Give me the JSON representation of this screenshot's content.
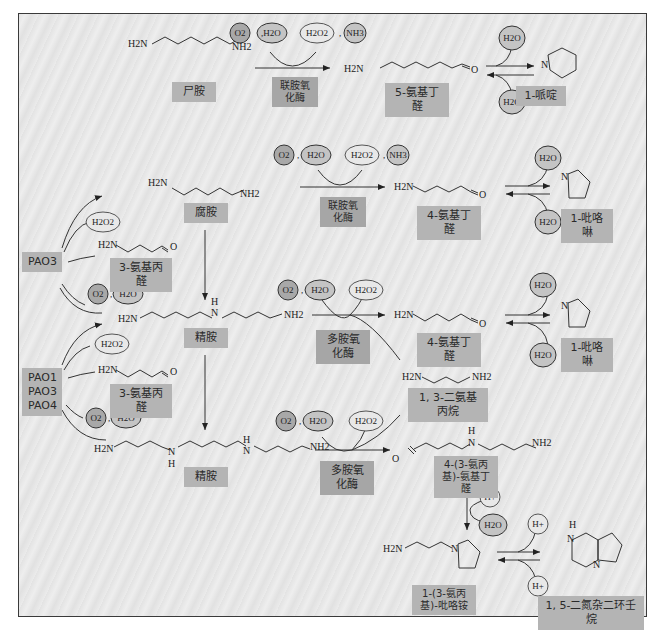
{
  "figure": {
    "colors": {
      "frame_border": "#3a3a3a",
      "label_bg": "#b4b4b4",
      "reactant_circle_fill": "#a8a8a8",
      "water_circle_fill": "#c4c4c4",
      "product_circle_fill": "#e8e8e8"
    },
    "row1": {
      "substrate_formula_left": "H2N",
      "substrate_formula_right": "NH2",
      "substrate_label": "尸胺",
      "cofactors_in": [
        "O2",
        "H2O"
      ],
      "cofactors_out": [
        "H2O2",
        "NH3"
      ],
      "enzyme_label": "联胺氧化酶",
      "product_formula_left": "H2N",
      "product_formula_right": "O",
      "product_label": "5-氨基丁醛",
      "eq_water_top": "H2O",
      "eq_water_bottom": "H2O",
      "cyclic_atom": "N",
      "cyclic_label": "1-哌啶"
    },
    "row2": {
      "substrate_formula_left": "H2N",
      "substrate_formula_right": "NH2",
      "substrate_label": "腐胺",
      "cofactors_in": [
        "O2",
        "H2O"
      ],
      "cofactors_out": [
        "H2O2",
        "NH3"
      ],
      "enzyme_label": "联胺氧化酶",
      "product_formula_left": "H2N",
      "product_formula_right": "O",
      "product_label": "4-氨基丁醛",
      "eq_water_top": "H2O",
      "eq_water_bottom": "H2O",
      "cyclic_atom": "N",
      "cyclic_label": "1-吡咯啉"
    },
    "pao3": {
      "enzyme_label": "PAO3",
      "byproduct_h2o2": "H2O2",
      "byproduct_formula_left": "H2N",
      "byproduct_formula_right": "O",
      "byproduct_label": "3-氨基丙醛",
      "cofactors_in": [
        "O2",
        "H2O"
      ]
    },
    "row3": {
      "substrate_formula_left": "H2N",
      "substrate_formula_mid_h": "H",
      "substrate_formula_mid_n": "N",
      "substrate_formula_right": "NH2",
      "substrate_label": "精胺",
      "cofactors_in": [
        "O2",
        "H2O"
      ],
      "cofactors_out": [
        "H2O2"
      ],
      "enzyme_label": "多胺氧化酶",
      "product_formula_left": "H2N",
      "product_formula_right": "O",
      "product_label": "4-氨基丁醛",
      "side_product_left": "H2N",
      "side_product_right": "NH2",
      "side_product_label": "1, 3-二氨基丙烷",
      "eq_water_top": "H2O",
      "eq_water_bottom": "H2O",
      "cyclic_atom": "N",
      "cyclic_label": "1-吡咯啉"
    },
    "pao134": {
      "enzyme_labels": [
        "PAO1",
        "PAO3",
        "PAO4"
      ],
      "byproduct_h2o2": "H2O2",
      "byproduct_formula_left": "H2N",
      "byproduct_formula_right": "O",
      "byproduct_label": "3-氨基丙醛",
      "cofactors_in": [
        "O2",
        "H2O"
      ]
    },
    "row4": {
      "substrate_formula_left": "H2N",
      "substrate_formula_n1": "N",
      "substrate_formula_h1": "H",
      "substrate_formula_n2": "N",
      "substrate_formula_h2": "H",
      "substrate_formula_right": "NH2",
      "substrate_label": "精胺",
      "cofactors_in": [
        "O2",
        "H2O"
      ],
      "cofactors_out": [
        "H2O2"
      ],
      "enzyme_label": "多胺氧化酶",
      "product_formula_o": "O",
      "product_formula_h": "H",
      "product_formula_n": "N",
      "product_formula_right": "NH2",
      "product_label": "4-(3-氨丙基)-氨基丁醛",
      "step_in": "H+",
      "step_out": "H2O",
      "cyclic_formula_left": "H2N",
      "cyclic_formula_n": "N",
      "cyclic_label": "1-(3-氨丙基)-吡咯铵",
      "eq_top": "H+",
      "eq_bottom": "H+",
      "bicyclic_h": "H",
      "bicyclic_n1": "N",
      "bicyclic_n2": "N",
      "bicyclic_label": "1, 5-二氮杂二环壬烷"
    }
  }
}
